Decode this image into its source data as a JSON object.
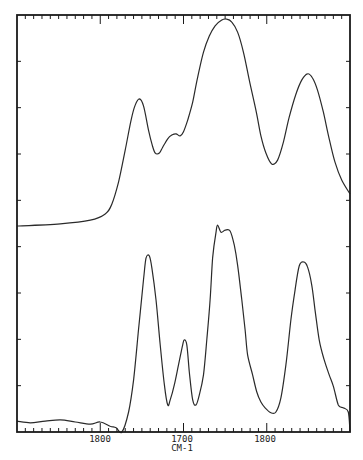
{
  "chart_data": {
    "type": "line",
    "title": "",
    "xlabel": "CM-1",
    "ylabel": "",
    "xlim": [
      1500,
      1900
    ],
    "ylim": [
      0,
      100
    ],
    "grid": false,
    "legend": null,
    "x_tick_labels": [
      {
        "value": 1600,
        "text": "1800"
      },
      {
        "value": 1700,
        "text": "1700"
      },
      {
        "value": 1800,
        "text": "1800"
      }
    ],
    "x_minor_tick_step": 10,
    "y_tick_count": 9,
    "colors": {
      "line": "#2a2a2a",
      "axis": "#1a1a1a",
      "background": "#ffffff"
    },
    "series": [
      {
        "name": "upper spectrum",
        "points": [
          [
            1500,
            49.4
          ],
          [
            1552,
            49.9
          ],
          [
            1588,
            50.8
          ],
          [
            1606,
            52.3
          ],
          [
            1614,
            54.7
          ],
          [
            1622,
            60.0
          ],
          [
            1630,
            67.6
          ],
          [
            1637,
            74.8
          ],
          [
            1642,
            78.4
          ],
          [
            1647,
            79.9
          ],
          [
            1652,
            78.2
          ],
          [
            1658,
            72.4
          ],
          [
            1662,
            69.1
          ],
          [
            1666,
            66.9
          ],
          [
            1671,
            66.9
          ],
          [
            1675,
            68.3
          ],
          [
            1681,
            70.3
          ],
          [
            1686,
            71.2
          ],
          [
            1691,
            71.5
          ],
          [
            1696,
            71.0
          ],
          [
            1700,
            72.0
          ],
          [
            1705,
            74.8
          ],
          [
            1711,
            79.1
          ],
          [
            1717,
            85.1
          ],
          [
            1724,
            91.1
          ],
          [
            1731,
            95.0
          ],
          [
            1738,
            97.4
          ],
          [
            1746,
            98.8
          ],
          [
            1752,
            99.0
          ],
          [
            1758,
            98.3
          ],
          [
            1765,
            95.9
          ],
          [
            1772,
            91.1
          ],
          [
            1779,
            84.4
          ],
          [
            1787,
            77.2
          ],
          [
            1793,
            71.0
          ],
          [
            1799,
            66.9
          ],
          [
            1806,
            64.3
          ],
          [
            1813,
            65.2
          ],
          [
            1820,
            69.5
          ],
          [
            1827,
            75.5
          ],
          [
            1835,
            81.0
          ],
          [
            1842,
            84.4
          ],
          [
            1849,
            85.9
          ],
          [
            1855,
            84.9
          ],
          [
            1861,
            82.0
          ],
          [
            1868,
            76.7
          ],
          [
            1875,
            70.3
          ],
          [
            1882,
            64.7
          ],
          [
            1890,
            60.4
          ],
          [
            1900,
            57.1
          ]
        ]
      },
      {
        "name": "lower spectrum",
        "points": [
          [
            1500,
            2.6
          ],
          [
            1516,
            2.2
          ],
          [
            1534,
            2.6
          ],
          [
            1552,
            2.9
          ],
          [
            1570,
            2.4
          ],
          [
            1588,
            1.9
          ],
          [
            1600,
            2.4
          ],
          [
            1612,
            1.4
          ],
          [
            1619,
            1.0
          ],
          [
            1626,
            0.0
          ],
          [
            1634,
            4.8
          ],
          [
            1640,
            12.5
          ],
          [
            1646,
            24.5
          ],
          [
            1652,
            36.5
          ],
          [
            1655,
            41.7
          ],
          [
            1659,
            42.2
          ],
          [
            1662,
            39.3
          ],
          [
            1667,
            31.7
          ],
          [
            1672,
            20.9
          ],
          [
            1677,
            11.3
          ],
          [
            1681,
            6.5
          ],
          [
            1684,
            7.7
          ],
          [
            1689,
            11.3
          ],
          [
            1694,
            16.1
          ],
          [
            1699,
            20.9
          ],
          [
            1701,
            22.1
          ],
          [
            1704,
            20.9
          ],
          [
            1707,
            14.4
          ],
          [
            1711,
            7.7
          ],
          [
            1715,
            6.5
          ],
          [
            1719,
            8.9
          ],
          [
            1724,
            13.7
          ],
          [
            1728,
            22.1
          ],
          [
            1732,
            31.7
          ],
          [
            1735,
            41.7
          ],
          [
            1739,
            47.9
          ],
          [
            1741,
            49.6
          ],
          [
            1745,
            47.9
          ],
          [
            1750,
            48.4
          ],
          [
            1756,
            48.2
          ],
          [
            1761,
            44.8
          ],
          [
            1765,
            40.0
          ],
          [
            1770,
            31.7
          ],
          [
            1774,
            24.5
          ],
          [
            1777,
            18.5
          ],
          [
            1783,
            13.7
          ],
          [
            1788,
            9.6
          ],
          [
            1793,
            7.2
          ],
          [
            1798,
            5.8
          ],
          [
            1805,
            4.6
          ],
          [
            1811,
            4.8
          ],
          [
            1817,
            8.2
          ],
          [
            1823,
            16.1
          ],
          [
            1829,
            26.9
          ],
          [
            1834,
            34.1
          ],
          [
            1839,
            39.8
          ],
          [
            1844,
            40.8
          ],
          [
            1849,
            39.6
          ],
          [
            1854,
            35.3
          ],
          [
            1858,
            29.3
          ],
          [
            1863,
            22.1
          ],
          [
            1869,
            17.3
          ],
          [
            1875,
            13.7
          ],
          [
            1880,
            11.0
          ],
          [
            1886,
            6.5
          ],
          [
            1892,
            5.8
          ],
          [
            1898,
            4.8
          ],
          [
            1900,
            0.0
          ]
        ]
      }
    ]
  },
  "axis": {
    "x_unit_label": "CM-1",
    "x_labels": [
      "1800",
      "1700",
      "1800"
    ]
  }
}
